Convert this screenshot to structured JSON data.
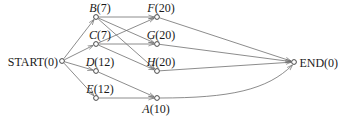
{
  "diagram": {
    "type": "activity network",
    "nodes": [
      {
        "id": "START",
        "label": "START(0)",
        "name": "START",
        "value": "0",
        "x": 62,
        "y": 61,
        "label_pos": "left"
      },
      {
        "id": "B",
        "label": "B(7)",
        "name": "B",
        "value": "7",
        "x": 96,
        "y": 17,
        "label_pos": "above"
      },
      {
        "id": "C",
        "label": "C(7)",
        "name": "C",
        "value": "7",
        "x": 96,
        "y": 44,
        "label_pos": "above"
      },
      {
        "id": "D",
        "label": "D(12)",
        "name": "D",
        "value": "12",
        "x": 96,
        "y": 71,
        "label_pos": "above"
      },
      {
        "id": "E",
        "label": "E(12)",
        "name": "E",
        "value": "12",
        "x": 96,
        "y": 98,
        "label_pos": "above"
      },
      {
        "id": "F",
        "label": "F(20)",
        "name": "F",
        "value": "20",
        "x": 157,
        "y": 17,
        "label_pos": "above"
      },
      {
        "id": "G",
        "label": "G(20)",
        "name": "G",
        "value": "20",
        "x": 157,
        "y": 44,
        "label_pos": "above"
      },
      {
        "id": "H",
        "label": "H(20)",
        "name": "H",
        "value": "20",
        "x": 157,
        "y": 71,
        "label_pos": "above"
      },
      {
        "id": "A",
        "label": "A(10)",
        "name": "A",
        "value": "10",
        "x": 157,
        "y": 98,
        "label_pos": "below"
      },
      {
        "id": "END",
        "label": "END(0)",
        "name": "END",
        "value": "0",
        "x": 294,
        "y": 62,
        "label_pos": "right"
      }
    ],
    "edges": [
      {
        "from": "START",
        "to": "B"
      },
      {
        "from": "START",
        "to": "C"
      },
      {
        "from": "START",
        "to": "D"
      },
      {
        "from": "START",
        "to": "E"
      },
      {
        "from": "B",
        "to": "F"
      },
      {
        "from": "B",
        "to": "G"
      },
      {
        "from": "B",
        "to": "H"
      },
      {
        "from": "C",
        "to": "F"
      },
      {
        "from": "C",
        "to": "G"
      },
      {
        "from": "C",
        "to": "H"
      },
      {
        "from": "D",
        "to": "A"
      },
      {
        "from": "E",
        "to": "A"
      },
      {
        "from": "F",
        "to": "END"
      },
      {
        "from": "G",
        "to": "END"
      },
      {
        "from": "H",
        "to": "END"
      },
      {
        "from": "A",
        "to": "END",
        "curved": true
      }
    ]
  }
}
